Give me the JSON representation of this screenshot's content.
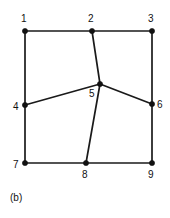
{
  "figure": {
    "caption": "(b)",
    "background_color": "#ffffff",
    "line_color": "#1a1a1a",
    "node_color": "#111111",
    "label_color": "#111111",
    "width": 170,
    "height": 218
  },
  "chart_data": {
    "type": "diagram",
    "title": "",
    "subtitle": "",
    "xlabel": "",
    "ylabel": "",
    "grid": false,
    "legend": "none",
    "nodes": [
      {
        "id": "1",
        "label": "1",
        "x": 25,
        "y": 31,
        "label_x": 21,
        "label_y": 14
      },
      {
        "id": "2",
        "label": "2",
        "x": 92,
        "y": 31,
        "label_x": 88,
        "label_y": 14
      },
      {
        "id": "3",
        "label": "3",
        "x": 152,
        "y": 31,
        "label_x": 148,
        "label_y": 14
      },
      {
        "id": "4",
        "label": "4",
        "x": 25,
        "y": 105,
        "label_x": 13,
        "label_y": 102
      },
      {
        "id": "5",
        "label": "5",
        "x": 100,
        "y": 84,
        "label_x": 89,
        "label_y": 89
      },
      {
        "id": "6",
        "label": "6",
        "x": 152,
        "y": 104,
        "label_x": 157,
        "label_y": 100
      },
      {
        "id": "7",
        "label": "7",
        "x": 25,
        "y": 163,
        "label_x": 13,
        "label_y": 160
      },
      {
        "id": "8",
        "label": "8",
        "x": 86,
        "y": 163,
        "label_x": 82,
        "label_y": 170
      },
      {
        "id": "9",
        "label": "9",
        "x": 152,
        "y": 163,
        "label_x": 148,
        "label_y": 170
      }
    ],
    "edges": [
      {
        "from": "1",
        "to": "2"
      },
      {
        "from": "2",
        "to": "3"
      },
      {
        "from": "1",
        "to": "4"
      },
      {
        "from": "4",
        "to": "7"
      },
      {
        "from": "3",
        "to": "6"
      },
      {
        "from": "6",
        "to": "9"
      },
      {
        "from": "7",
        "to": "8"
      },
      {
        "from": "8",
        "to": "9"
      },
      {
        "from": "2",
        "to": "5"
      },
      {
        "from": "4",
        "to": "5"
      },
      {
        "from": "5",
        "to": "6"
      },
      {
        "from": "5",
        "to": "8"
      }
    ],
    "node_radius": 2.6
  }
}
